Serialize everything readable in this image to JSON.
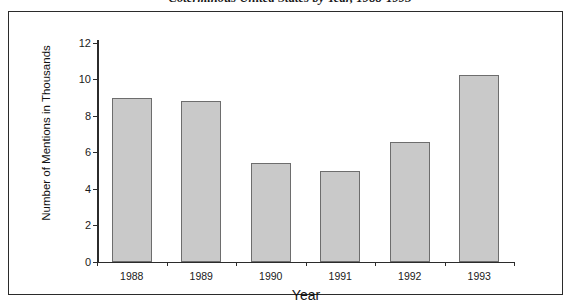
{
  "chart_data": {
    "type": "bar",
    "title": "Coterminous United States by Year, 1988-1993",
    "xlabel": "Year",
    "ylabel": "Number of Mentions in Thousands",
    "categories": [
      "1988",
      "1989",
      "1990",
      "1991",
      "1992",
      "1993"
    ],
    "values": [
      9.0,
      8.8,
      5.45,
      5.0,
      6.6,
      10.25
    ],
    "series": [
      {
        "name": "Number of Mentions in Thousands",
        "values": [
          9.0,
          8.8,
          5.45,
          5.0,
          6.6,
          10.25
        ]
      }
    ],
    "ylim": [
      0,
      12
    ],
    "yticks": [
      0,
      2,
      4,
      6,
      8,
      10,
      12
    ],
    "ytick_labels": [
      "0",
      "2",
      "4",
      "6",
      "8",
      "10",
      "12"
    ],
    "grid": false,
    "legend": false,
    "legend_position": "none",
    "bar_fill_color": "#c9c9c9",
    "bar_edge_color": "#6d6d6d",
    "axis_color": "#2b2b2b",
    "background_color": "#ffffff"
  }
}
